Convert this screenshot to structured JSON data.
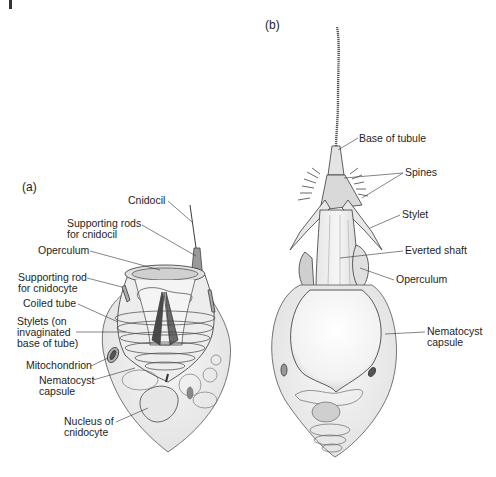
{
  "figure": {
    "panels": [
      {
        "id": "a",
        "label": "(a)",
        "callouts": [
          {
            "text": "Cnidocil"
          },
          {
            "text": "Supporting rods\nfor cnidocil"
          },
          {
            "text": "Operculum"
          },
          {
            "text": "Supporting rod\nfor cnidocyte"
          },
          {
            "text": "Coiled tube"
          },
          {
            "text": "Stylets (on\ninvaginated\nbase of tube)"
          },
          {
            "text": "Mitochondrion"
          },
          {
            "text": "Nematocyst\ncapsule"
          },
          {
            "text": "Nucleus of\ncnidocyte"
          }
        ]
      },
      {
        "id": "b",
        "label": "(b)",
        "callouts": [
          {
            "text": "Base of tubule"
          },
          {
            "text": "Spines"
          },
          {
            "text": "Stylet"
          },
          {
            "text": "Everted shaft"
          },
          {
            "text": "Operculum"
          },
          {
            "text": "Nematocyst\ncapsule"
          }
        ]
      }
    ],
    "colors": {
      "ink": "#1e1e1e",
      "line": "#3a3a3a",
      "stipple": "#e4e4e4",
      "dark": "#555555"
    }
  }
}
